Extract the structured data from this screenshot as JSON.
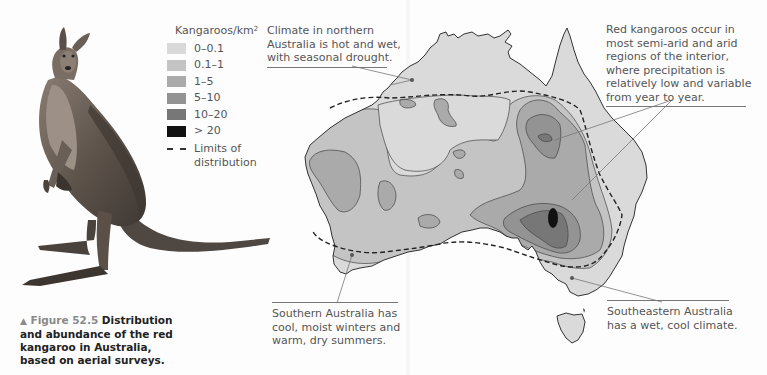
{
  "figure": {
    "marker": "▲",
    "number": "Figure 52.5",
    "caption": "Distribution and abundance of the red kangaroo in Australia, based on aerial surveys."
  },
  "legend": {
    "title": "Kangaroos/km",
    "title_superscript": "2",
    "items": [
      {
        "label": "0–0.1",
        "color": "#d9d9d9"
      },
      {
        "label": "0.1–1",
        "color": "#c4c4c4"
      },
      {
        "label": "1–5",
        "color": "#aaaaaa"
      },
      {
        "label": "5–10",
        "color": "#939393"
      },
      {
        "label": "10–20",
        "color": "#777777"
      },
      {
        "label": "> 20",
        "color": "#111111"
      }
    ],
    "limits_line1": "Limits of",
    "limits_line2": "distribution"
  },
  "callouts": {
    "north": {
      "lines": [
        "Climate in northern",
        "Australia is hot and wet,",
        "with seasonal drought."
      ]
    },
    "interior": {
      "lines": [
        "Red kangaroos occur in",
        "most semi-arid and arid",
        "regions of the interior,",
        "where precipitation is",
        "relatively low and variable",
        "from year to year."
      ]
    },
    "south": {
      "lines": [
        "Southern Australia has",
        "cool, moist winters and",
        "warm, dry summers."
      ]
    },
    "southeast": {
      "lines": [
        "Southeastern Australia",
        "has a wet, cool climate."
      ]
    }
  },
  "colors": {
    "land": "#dadada",
    "outline": "#333333",
    "text": "#555555",
    "caption_text": "#222222",
    "figure_label": "#8a8a8a"
  }
}
